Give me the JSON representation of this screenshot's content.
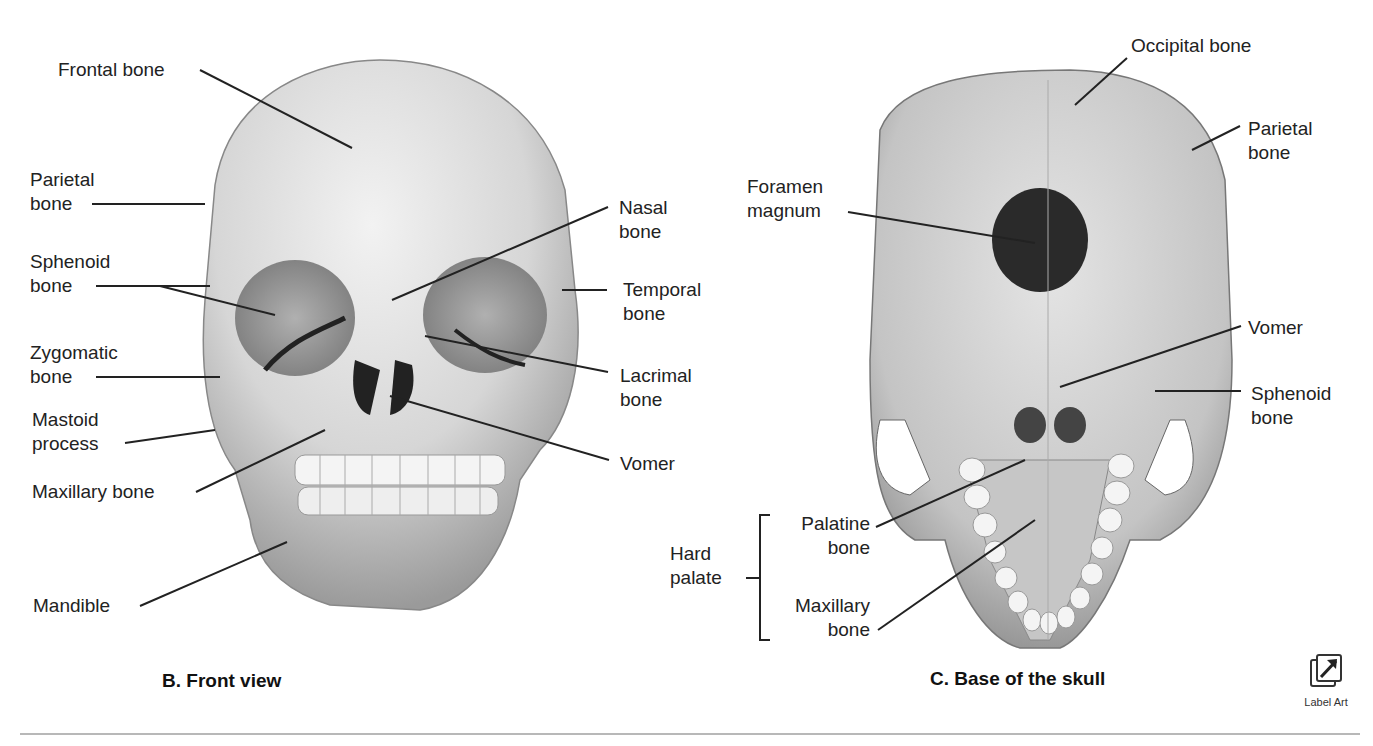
{
  "figure_b": {
    "caption": "B.  Front view",
    "labels": {
      "frontal": "Frontal bone",
      "parietal": "Parietal\nbone",
      "sphenoid": "Sphenoid\nbone",
      "zygomatic": "Zygomatic\nbone",
      "mastoid": "Mastoid\nprocess",
      "maxillary": "Maxillary bone",
      "mandible": "Mandible",
      "nasal": "Nasal\nbone",
      "temporal": "Temporal\nbone",
      "lacrimal": "Lacrimal\nbone",
      "vomer": "Vomer"
    }
  },
  "figure_c": {
    "caption": "C.  Base of the skull",
    "labels": {
      "occipital": "Occipital bone",
      "parietal": "Parietal\nbone",
      "foramen": "Foramen\nmagnum",
      "vomer": "Vomer",
      "sphenoid": "Sphenoid\nbone",
      "hard_palate": "Hard\npalate",
      "palatine": "Palatine\nbone",
      "maxillary": "Maxillary\nbone"
    }
  },
  "label_art": {
    "icon": "label-art-arrow-icon",
    "text": "Label Art"
  }
}
